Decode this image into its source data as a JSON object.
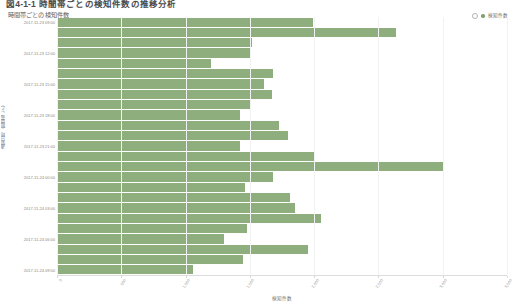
{
  "page": {
    "title": "図4-1-1 時間帯ごとの検知件数の推移分析"
  },
  "chart": {
    "subtitle": "時間帯ごとの検知件数",
    "legend": {
      "toggle_icon": "circle-outline-icon",
      "swatch_icon": "circle-filled-icon",
      "label": "検知件数"
    },
    "x_axis_title": "検知件数",
    "y_axis_title": "通知日時（時間帯ごと）",
    "bar_color": "#8fae7e",
    "grid_color": "#f2f2f2"
  },
  "chart_data": {
    "type": "bar",
    "orientation": "horizontal",
    "title": "時間帯ごとの検知件数",
    "xlabel": "検知件数",
    "ylabel": "通知日時（時間帯ごと）",
    "xlim": [
      0,
      3500
    ],
    "grid": true,
    "legend_position": "top-right",
    "series": [
      {
        "name": "検知件数",
        "color": "#8fae7e",
        "values": [
          1990,
          2640,
          1520,
          1510,
          1200,
          1680,
          1610,
          1670,
          1500,
          1420,
          1730,
          1800,
          1420,
          2000,
          3000,
          1680,
          1460,
          1810,
          1850,
          2050,
          1480,
          1300,
          1950,
          1450,
          1060
        ]
      }
    ],
    "categories": [
      "2017-11-23 09:00",
      "2017-11-23 10:00",
      "2017-11-23 11:00",
      "2017-11-23 12:00",
      "2017-11-23 13:00",
      "2017-11-23 14:00",
      "2017-11-23 15:00",
      "2017-11-23 16:00",
      "2017-11-23 17:00",
      "2017-11-23 18:00",
      "2017-11-23 19:00",
      "2017-11-23 20:00",
      "2017-11-23 21:00",
      "2017-11-23 22:00",
      "2017-11-23 23:00",
      "2017-11-24 00:00",
      "2017-11-24 01:00",
      "2017-11-24 02:00",
      "2017-11-24 03:00",
      "2017-11-24 04:00",
      "2017-11-24 05:00",
      "2017-11-24 06:00",
      "2017-11-24 07:00",
      "2017-11-24 08:00",
      "2017-11-24 09:00"
    ],
    "y_tick_labels": [
      "2017-11-23 09:00",
      "2017-11-23 12:00",
      "2017-11-23 15:00",
      "2017-11-23 18:00",
      "2017-11-23 21:00",
      "2017-11-24 00:00",
      "2017-11-24 03:00",
      "2017-11-24 06:00",
      "2017-11-24 09:00"
    ],
    "x_tick_labels": [
      "0",
      "500",
      "1,000",
      "1,500",
      "2,000",
      "2,500",
      "3,000",
      "3,500"
    ]
  }
}
